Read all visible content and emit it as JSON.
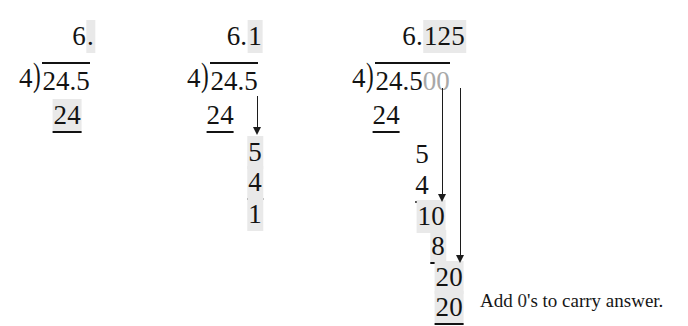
{
  "figure": {
    "highlight_color": "#e9e9e9",
    "faint_color": "#a8a8a8",
    "ink_color": "#131313",
    "background_color": "#ffffff"
  },
  "steps": [
    {
      "id": "step-1",
      "quotient": {
        "plain": "6",
        "highlighted": "."
      },
      "divisor": "4",
      "bracket": ")",
      "dividend": {
        "plain": "24.5",
        "added_zeros": ""
      },
      "work": [
        {
          "value": "24",
          "underlined": true,
          "highlighted": true
        }
      ],
      "arrows": 0
    },
    {
      "id": "step-2",
      "quotient": {
        "plain": "6.",
        "highlighted": "1"
      },
      "divisor": "4",
      "bracket": ")",
      "dividend": {
        "plain": "24.5",
        "added_zeros": ""
      },
      "work": [
        {
          "value": "24",
          "underlined": true,
          "highlighted": false
        },
        {
          "value": "5",
          "underlined": false,
          "highlighted": true
        },
        {
          "value": "4",
          "underlined": true,
          "highlighted": true
        },
        {
          "value": "1",
          "underlined": false,
          "highlighted": true
        }
      ],
      "arrows": 1
    },
    {
      "id": "step-3",
      "quotient": {
        "plain": "6.",
        "highlighted": "125"
      },
      "divisor": "4",
      "bracket": ")",
      "dividend": {
        "plain": "24.5",
        "added_zeros": "00"
      },
      "work": [
        {
          "value": "24",
          "underlined": true,
          "highlighted": false
        },
        {
          "value": "5",
          "underlined": false,
          "highlighted": false
        },
        {
          "value": "4",
          "underlined": true,
          "highlighted": false
        },
        {
          "value": "10",
          "underlined": false,
          "highlighted": true
        },
        {
          "value": "8",
          "underlined": true,
          "highlighted": true
        },
        {
          "value": "20",
          "underlined": false,
          "highlighted": true
        },
        {
          "value": "20",
          "underlined": true,
          "highlighted": true
        }
      ],
      "arrows": 2
    }
  ],
  "caption": {
    "before": "Add ",
    "zero": "0",
    "after": "'s to carry answer."
  }
}
